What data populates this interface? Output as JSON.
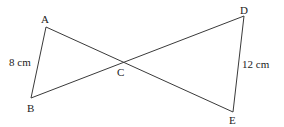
{
  "diagram": {
    "type": "geometry",
    "points": {
      "A": {
        "label": "A",
        "x": 46,
        "y": 27
      },
      "B": {
        "label": "B",
        "x": 31,
        "y": 98
      },
      "C": {
        "label": "C",
        "x": 123,
        "y": 62
      },
      "D": {
        "label": "D",
        "x": 244,
        "y": 16
      },
      "E": {
        "label": "E",
        "x": 233,
        "y": 112
      }
    },
    "segments": [
      {
        "from": "A",
        "to": "B"
      },
      {
        "from": "A",
        "to": "E"
      },
      {
        "from": "B",
        "to": "D"
      },
      {
        "from": "D",
        "to": "E"
      }
    ],
    "measurements": {
      "AB": "8 cm",
      "DE": "12 cm"
    },
    "colors": {
      "line": "#3a3a3a",
      "text": "#222222",
      "background": "#ffffff"
    }
  }
}
